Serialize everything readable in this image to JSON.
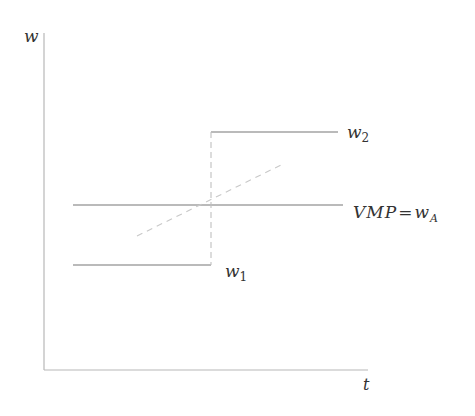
{
  "diagram": {
    "axes": {
      "y_label": "w",
      "x_label": "t",
      "color": "#b8b8b8"
    },
    "lines": {
      "w1": {
        "label_main": "w",
        "label_sub": "1",
        "y": 265,
        "x_start": 73,
        "x_end": 211
      },
      "w2": {
        "label_main": "w",
        "label_sub": "2",
        "y": 132,
        "x_start": 211,
        "x_end": 338
      },
      "vmp": {
        "label_main": "VMP",
        "label_eq": "=",
        "label_w": "w",
        "label_sub": "A",
        "y": 205,
        "x_start": 73,
        "x_end": 343
      }
    },
    "dashed": {
      "vertical": {
        "x": 211,
        "y_start": 132,
        "y_end": 265
      },
      "diagonal": {
        "x1": 137,
        "y1": 236,
        "x2": 283,
        "y2": 164
      }
    },
    "colors": {
      "solid_line": "#777777",
      "dashed_line": "#c0c0c0",
      "text": "#333333"
    }
  }
}
